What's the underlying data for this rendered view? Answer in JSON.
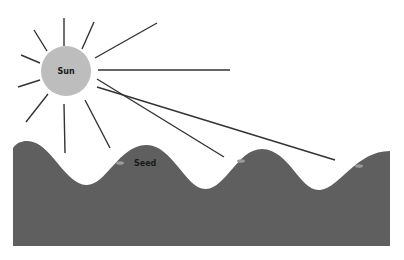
{
  "diagram": {
    "sun": {
      "label": "Sun",
      "cx": 66,
      "cy": 71,
      "r": 25,
      "fill": "#bdbdbd"
    },
    "ground": {
      "fill": "#5f5f5f",
      "path": "M13,148 C18,141 26,140 33,142 C52,147 66,184 86,185 C106,186 118,146 146,145 C172,144 186,190 206,189 C226,188 238,149 262,149 C290,150 300,192 320,190 C340,188 356,151 390,151 L390,246 L13,246 Z"
    },
    "seeds": [
      {
        "cx": 120,
        "cy": 163,
        "label": "Seed"
      },
      {
        "cx": 241,
        "cy": 161,
        "label": ""
      },
      {
        "cx": 359,
        "cy": 166,
        "label": ""
      }
    ],
    "ray_color": "#333333",
    "rays": [
      {
        "x1": 64,
        "y1": 46,
        "x2": 64,
        "y2": 18
      },
      {
        "x1": 82,
        "y1": 49,
        "x2": 94,
        "y2": 22
      },
      {
        "x1": 47,
        "y1": 51,
        "x2": 34,
        "y2": 30
      },
      {
        "x1": 40,
        "y1": 63,
        "x2": 21,
        "y2": 55
      },
      {
        "x1": 40,
        "y1": 80,
        "x2": 18,
        "y2": 87
      },
      {
        "x1": 48,
        "y1": 94,
        "x2": 26,
        "y2": 122
      },
      {
        "x1": 64,
        "y1": 104,
        "x2": 65,
        "y2": 153
      },
      {
        "x1": 85,
        "y1": 100,
        "x2": 110,
        "y2": 148
      },
      {
        "x1": 95,
        "y1": 58,
        "x2": 157,
        "y2": 23
      },
      {
        "x1": 98,
        "y1": 70,
        "x2": 230,
        "y2": 70
      },
      {
        "x1": 97,
        "y1": 79,
        "x2": 224,
        "y2": 157
      },
      {
        "x1": 97,
        "y1": 87,
        "x2": 335,
        "y2": 160
      }
    ]
  }
}
